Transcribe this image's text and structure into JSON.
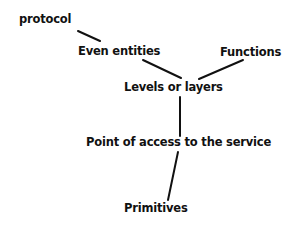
{
  "diagram": {
    "type": "tree",
    "nodes": [
      {
        "id": "protocol",
        "label": "protocol"
      },
      {
        "id": "even_entities",
        "label": "Even entities"
      },
      {
        "id": "functions",
        "label": "Functions"
      },
      {
        "id": "levels",
        "label": "Levels or layers"
      },
      {
        "id": "access_point",
        "label": "Point of access to the service"
      },
      {
        "id": "primitives",
        "label": "Primitives"
      }
    ],
    "edges": [
      [
        "protocol",
        "even_entities"
      ],
      [
        "even_entities",
        "levels"
      ],
      [
        "functions",
        "levels"
      ],
      [
        "levels",
        "access_point"
      ],
      [
        "access_point",
        "primitives"
      ]
    ]
  }
}
